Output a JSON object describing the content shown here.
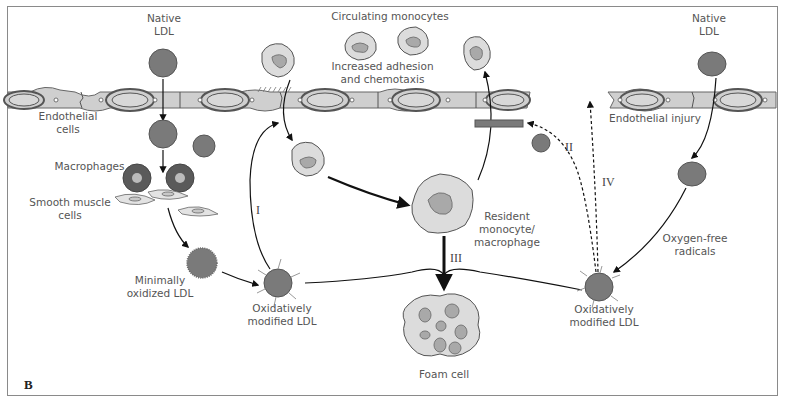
{
  "figure": {
    "panel_letter": "B",
    "colors": {
      "ldl_fill": "#7a7a7a",
      "cell_fill": "#dcdcdc",
      "nucleus_fill": "#a9a9a9",
      "endothelium_fill": "#cfcfcf",
      "outline": "#555555",
      "arrow": "#111111",
      "label_text": "#555555"
    }
  },
  "labels": {
    "native_ldl_left": "Native\nLDL",
    "native_ldl_right": "Native\nLDL",
    "endothelial_cells": "Endothelial\ncells",
    "macrophages": "Macrophages",
    "smooth_muscle_cells": "Smooth muscle\ncells",
    "minimally_oxidized_ldl": "Minimally\noxidized LDL",
    "oxidatively_modified_ldl_left": "Oxidatively\nmodified LDL",
    "oxidatively_modified_ldl_right": "Oxidatively\nmodified LDL",
    "circulating_monocytes": "Circulating monocytes",
    "increased_adhesion": "Increased adhesion\nand chemotaxis",
    "resident_monocyte": "Resident\nmonocyte/\nmacrophage",
    "foam_cell": "Foam cell",
    "endothelial_injury": "Endothelial injury",
    "oxygen_free_radicals": "Oxygen-free\nradicals"
  },
  "pathways": {
    "I": "I",
    "II": "II",
    "III": "III",
    "IV": "IV"
  }
}
